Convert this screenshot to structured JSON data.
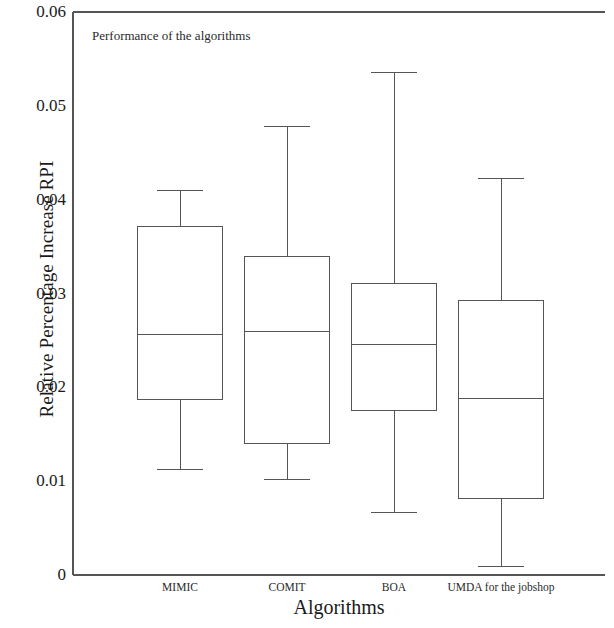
{
  "chart_data": {
    "type": "box",
    "title": "Performance of the algorithms",
    "xlabel": "Algorithms",
    "ylabel": "Relative Percentage Increase RPI",
    "categories": [
      "MIMIC",
      "COMIT",
      "BOA",
      "UMDA for the jobshop"
    ],
    "ylim": [
      0,
      0.06
    ],
    "yticks": [
      0,
      0.01,
      0.02,
      0.03,
      0.04,
      0.05,
      0.06
    ],
    "ytick_labels": [
      "0",
      "0.01",
      "0.02",
      "0.03",
      "0.04",
      "0.05",
      "0.06"
    ],
    "grid": false,
    "legend": "none",
    "series": [
      {
        "name": "MIMIC",
        "whisker_low": 0.0112,
        "q1": 0.0187,
        "median": 0.0256,
        "q3": 0.0371,
        "whisker_high": 0.041
      },
      {
        "name": "COMIT",
        "whisker_low": 0.0102,
        "q1": 0.014,
        "median": 0.026,
        "q3": 0.0339,
        "whisker_high": 0.0478
      },
      {
        "name": "BOA",
        "whisker_low": 0.0067,
        "q1": 0.0175,
        "median": 0.0246,
        "q3": 0.0311,
        "whisker_high": 0.0536
      },
      {
        "name": "UMDA for the jobshop",
        "whisker_low": 0.0009,
        "q1": 0.0082,
        "median": 0.0188,
        "q3": 0.0293,
        "whisker_high": 0.0423
      }
    ],
    "colors": {
      "box_stroke": "#555555",
      "axis": "#555555",
      "text": "#1a1a1a",
      "plot_background": "#ffffff"
    }
  }
}
